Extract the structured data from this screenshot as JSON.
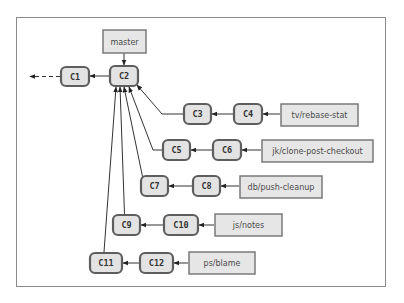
{
  "diagram": {
    "colors": {
      "node_fill": "#e3e3e3",
      "node_stroke": "#5e5e5e",
      "branch_fill": "#e6e6e6",
      "branch_stroke": "#7a7a7a",
      "edge": "#333333",
      "frame": "#8a8a8a"
    },
    "commits": [
      {
        "id": "C1",
        "x": 61,
        "y": 67,
        "w": 28,
        "h": 19
      },
      {
        "id": "C2",
        "x": 110,
        "y": 66,
        "w": 28,
        "h": 20
      },
      {
        "id": "C3",
        "x": 184,
        "y": 104,
        "w": 27,
        "h": 20
      },
      {
        "id": "C4",
        "x": 234,
        "y": 104,
        "w": 28,
        "h": 20
      },
      {
        "id": "C5",
        "x": 163,
        "y": 140,
        "w": 27,
        "h": 20
      },
      {
        "id": "C6",
        "x": 213,
        "y": 140,
        "w": 28,
        "h": 20
      },
      {
        "id": "C7",
        "x": 141,
        "y": 176,
        "w": 27,
        "h": 20
      },
      {
        "id": "C8",
        "x": 193,
        "y": 176,
        "w": 27,
        "h": 20
      },
      {
        "id": "C9",
        "x": 113,
        "y": 215,
        "w": 27,
        "h": 20
      },
      {
        "id": "C10",
        "x": 164,
        "y": 215,
        "w": 34,
        "h": 20
      },
      {
        "id": "C11",
        "x": 90,
        "y": 253,
        "w": 32,
        "h": 20
      },
      {
        "id": "C12",
        "x": 140,
        "y": 253,
        "w": 33,
        "h": 20
      }
    ],
    "branches": [
      {
        "name": "master",
        "x": 103,
        "y": 30,
        "w": 43,
        "h": 23,
        "points_to": "C2"
      },
      {
        "name": "tv/rebase-stat",
        "x": 281,
        "y": 104,
        "w": 77,
        "h": 22,
        "points_to": "C4"
      },
      {
        "name": "jk/clone-post-checkout",
        "x": 262,
        "y": 140,
        "w": 111,
        "h": 22,
        "points_to": "C6"
      },
      {
        "name": "db/push-cleanup",
        "x": 240,
        "y": 176,
        "w": 82,
        "h": 22,
        "points_to": "C8"
      },
      {
        "name": "js/notes",
        "x": 215,
        "y": 214,
        "w": 67,
        "h": 22,
        "points_to": "C10"
      },
      {
        "name": "ps/blame",
        "x": 189,
        "y": 252,
        "w": 66,
        "h": 22,
        "points_to": "C12"
      }
    ],
    "edges": [
      {
        "from": "C2",
        "to": "C1",
        "style": "solid"
      },
      {
        "from": "C1",
        "to": "earlier",
        "style": "dashed"
      },
      {
        "from": "C4",
        "to": "C3"
      },
      {
        "from": "C3",
        "to": "C2"
      },
      {
        "from": "C6",
        "to": "C5"
      },
      {
        "from": "C5",
        "to": "C2"
      },
      {
        "from": "C8",
        "to": "C7"
      },
      {
        "from": "C7",
        "to": "C2"
      },
      {
        "from": "C10",
        "to": "C9"
      },
      {
        "from": "C9",
        "to": "C2"
      },
      {
        "from": "C12",
        "to": "C11"
      },
      {
        "from": "C11",
        "to": "C2"
      }
    ]
  }
}
